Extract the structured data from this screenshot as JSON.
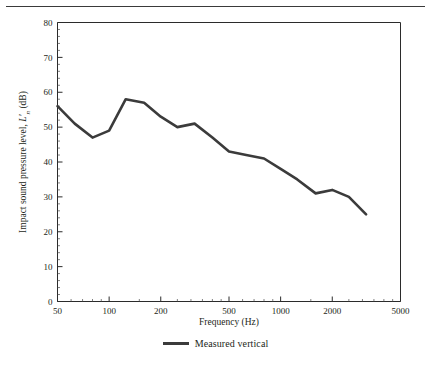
{
  "figure": {
    "has_top_rule": true,
    "background_color": "#ffffff",
    "line_color": "#3b3b3b",
    "axis_color": "#2b2b2b",
    "text_color": "#231f20"
  },
  "legend": {
    "position": "bottom-center",
    "entries": [
      {
        "label": "Measured vertical",
        "color": "#3b3b3b",
        "style": "solid"
      }
    ],
    "label": "Measured vertical"
  },
  "chart_data": {
    "type": "line",
    "title": "",
    "subtitle": "",
    "xlabel": "Frequency (Hz)",
    "ylabel": "Impact sound pressure level, L'n (dB)",
    "ylabel_parts": {
      "prefix": "Impact sound pressure level, ",
      "symbol": "L",
      "prime": "′",
      "subscript": "n",
      "suffix": " (dB)"
    },
    "xscale": "log",
    "yscale": "linear",
    "xlim": [
      50,
      5000
    ],
    "ylim": [
      0,
      80
    ],
    "grid": false,
    "xticks": [
      50,
      100,
      200,
      500,
      1000,
      2000,
      5000
    ],
    "xtick_labels": [
      "50",
      "100",
      "200",
      "500",
      "1000",
      "2000",
      "5000"
    ],
    "xminor_ticks": [
      60,
      70,
      80,
      90,
      150,
      250,
      300,
      350,
      400,
      450,
      600,
      700,
      800,
      900,
      1500,
      2500,
      3000,
      3500,
      4000,
      4500
    ],
    "yticks": [
      0,
      10,
      20,
      30,
      40,
      50,
      60,
      70,
      80
    ],
    "ytick_labels": [
      "0",
      "10",
      "20",
      "30",
      "40",
      "50",
      "60",
      "70",
      "80"
    ],
    "yminor_step": 2,
    "series": [
      {
        "name": "Measured vertical",
        "color": "#3b3b3b",
        "line_width": 2.6,
        "x": [
          50,
          63,
          80,
          100,
          125,
          160,
          200,
          250,
          315,
          400,
          500,
          630,
          800,
          1000,
          1250,
          1600,
          2000,
          2500,
          3150
        ],
        "values": [
          56,
          51,
          47,
          49,
          58,
          57,
          53,
          50,
          51,
          47,
          43,
          42,
          41,
          38,
          35,
          31,
          32,
          30,
          25
        ]
      }
    ]
  }
}
